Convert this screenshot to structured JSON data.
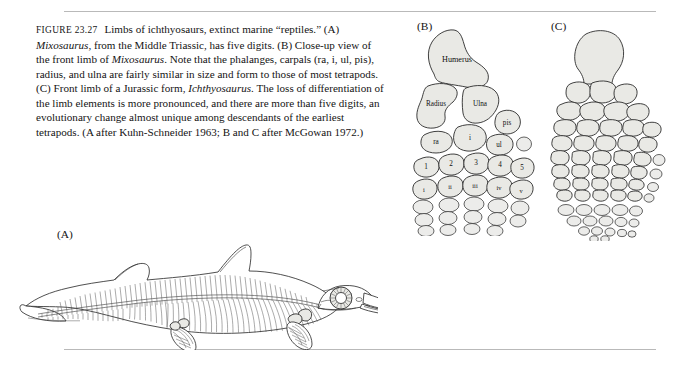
{
  "figure": {
    "label": "FIGURE 23.27",
    "caption_runs": [
      {
        "t": "Limbs of ichthyosaurs, extinct marine “reptiles.” (A) ",
        "i": false
      },
      {
        "t": "Mixosaurus",
        "i": true
      },
      {
        "t": ", from the Middle Triassic, has five digits. (B) Close-up view of the front limb of ",
        "i": false
      },
      {
        "t": "Mixosaurus",
        "i": true
      },
      {
        "t": ". Note that the phalanges, carpals (ra, i, ul, pis), radius, and ulna are fairly similar in size and form to those of most tetrapods. (C) Front limb of a Jurassic form, ",
        "i": false
      },
      {
        "t": "Ichthyosaurus",
        "i": true
      },
      {
        "t": ". The loss of differentiation of the limb elements is more pronounced, and there are more than five digits, an evolutionary change almost unique among descendants of the earliest tetrapods. (A after Kuhn-Schneider 1963; B and C after McGowan 1972.)",
        "i": false
      }
    ]
  },
  "panels": {
    "a": {
      "letter": "(A)",
      "subject": "Mixosaurus skeleton",
      "description": "Lateral view of a complete ichthyosaur skeleton inside a body outline; head to the right with long rostrum and large sclerotic eye ring, dorsal fin, downturned tail fluke to the left, two paddle-shaped flippers below the body."
    },
    "b": {
      "letter": "(B)",
      "subject": "Mixosaurus front limb",
      "bones": {
        "humerus": "Humerus",
        "radius": "Radius",
        "ulna": "Ulna",
        "pisiform": "pis"
      },
      "carpals": [
        "ra",
        "i",
        "ul"
      ],
      "metacarpals": [
        "1",
        "2",
        "3",
        "4",
        "5"
      ],
      "digits": [
        "i",
        "ii",
        "iii",
        "iv",
        "v"
      ]
    },
    "c": {
      "letter": "(C)",
      "subject": "Ichthyosaurus front limb",
      "description": "Paddle-shaped flipper built of many tightly packed, nearly identical polygonal bones arranged in more than five digit columns, tapering distally into small rounded ossicles."
    }
  },
  "style": {
    "bone_fill": "#e9e9e5",
    "bone_stroke": "#2b2b2b",
    "rule_color": "#b9b9b9",
    "text_color": "#141414",
    "page_background": "#ffffff"
  }
}
